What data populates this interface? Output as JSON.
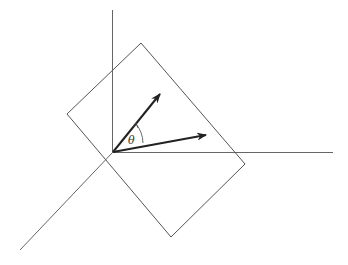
{
  "diagram": {
    "angle_label": "θ",
    "colors": {
      "axes": "#555555",
      "plane": "#444444",
      "vectors": "#222222"
    }
  }
}
